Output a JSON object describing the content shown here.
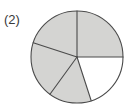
{
  "figure": {
    "label": "(2)",
    "type": "fraction-pie-diagram"
  },
  "chart_data": {
    "type": "pie",
    "title": "",
    "subtitle": "",
    "xlabel": "",
    "ylabel": "",
    "legend": [],
    "grid": false,
    "annotations": [
      "(2)"
    ],
    "center_x": 77,
    "center_y": 57,
    "radius": 46,
    "total_sectors": 5,
    "shaded_sectors": 4,
    "unshaded_sectors": 1,
    "fraction_shaded": "4/5",
    "categories": [
      "sector-1",
      "sector-2",
      "sector-3",
      "sector-4",
      "sector-5"
    ],
    "values": [
      72,
      72,
      72,
      72,
      72
    ],
    "slices": [
      {
        "name": "sector-1",
        "start_angle": 90,
        "end_angle": 162,
        "shaded": true
      },
      {
        "name": "sector-2",
        "start_angle": 162,
        "end_angle": 234,
        "shaded": true
      },
      {
        "name": "sector-3",
        "start_angle": 234,
        "end_angle": 288,
        "shaded": true
      },
      {
        "name": "sector-4",
        "start_angle": 288,
        "end_angle": 360,
        "shaded": false
      },
      {
        "name": "sector-5",
        "start_angle": 0,
        "end_angle": 90,
        "shaded": true
      }
    ],
    "colors": {
      "shaded_fill": "#d4d4d2",
      "unshaded_fill": "#ffffff",
      "stroke": "#4a4a4a",
      "background": "#ffffff",
      "label_text": "#3a3a3a"
    }
  }
}
